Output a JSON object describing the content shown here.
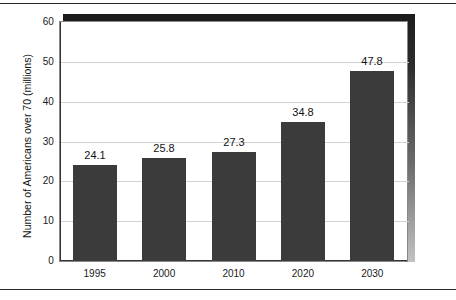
{
  "figure": {
    "background_color": "#ffffff",
    "plot_background_color": "#ffffff",
    "frame_color": "#888888",
    "shadow_color": "#1c1c1c"
  },
  "chart_data": {
    "type": "bar",
    "title": "",
    "subtitle": "",
    "xlabel": "",
    "ylabel": "Number of Americans over 70 (millions)",
    "categories": [
      "1995",
      "2000",
      "2010",
      "2020",
      "2030"
    ],
    "values": [
      24.1,
      25.8,
      27.3,
      34.8,
      47.8
    ],
    "value_labels": [
      "24.1",
      "25.8",
      "27.3",
      "34.8",
      "47.8"
    ],
    "series": [
      {
        "name": "Number of Americans over 70 (millions)",
        "values": [
          24.1,
          25.8,
          27.3,
          34.8,
          47.8
        ],
        "color": "#3b3b3b"
      }
    ],
    "ylim": [
      0,
      60
    ],
    "xlim": [
      0,
      5
    ],
    "yticks": [
      0,
      10,
      20,
      30,
      40,
      50,
      60
    ],
    "ytick_labels": [
      "0",
      "10",
      "20",
      "30",
      "40",
      "50",
      "60"
    ],
    "gridlines": {
      "horizontal": [
        10,
        20,
        30,
        40,
        50
      ],
      "vertical": [],
      "color": "#d2d2d2",
      "enabled": true
    },
    "legend": {
      "enabled": false,
      "position": "none",
      "entries": []
    },
    "bar_color": "#3b3b3b",
    "bar_value_labels_shown": true,
    "annotations": []
  }
}
